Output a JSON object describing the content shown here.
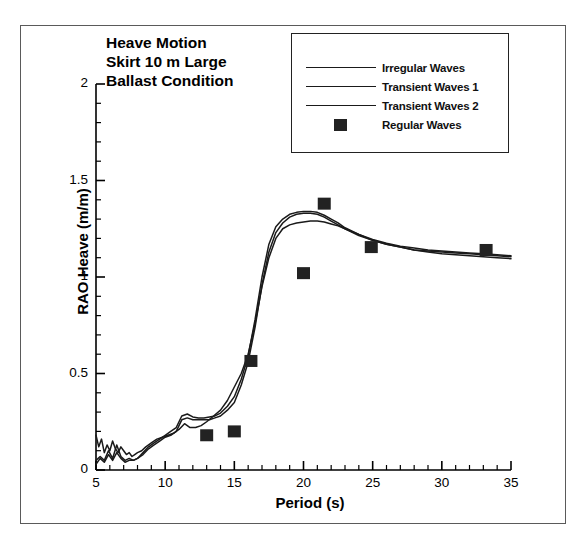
{
  "figure": {
    "title_lines": [
      "Heave Motion",
      "Skirt 10 m Large",
      "Ballast Condition"
    ]
  },
  "legend": {
    "entries": [
      {
        "label": "Irregular Waves",
        "marker": "line"
      },
      {
        "label": "Transient Waves 1",
        "marker": "line"
      },
      {
        "label": "Transient Waves 2",
        "marker": "line"
      },
      {
        "label": "Regular Waves",
        "marker": "square"
      }
    ]
  },
  "axes": {
    "x": {
      "label": "Period (s)",
      "ticks": [
        "5",
        "10",
        "15",
        "20",
        "25",
        "30",
        "35"
      ]
    },
    "y": {
      "label": "RAO Heave (m/m)",
      "ticks": [
        "0",
        "0.5",
        "1",
        "1.5",
        "2"
      ]
    }
  },
  "colors": {
    "line": "#1a1a1a",
    "marker": "#222222",
    "axis": "#000000",
    "frame": "#5a5a5a",
    "background": "#ffffff"
  },
  "chart_data": {
    "type": "line",
    "title": "Heave Motion Skirt 10 m Large Ballast Condition",
    "xlabel": "Period (s)",
    "ylabel": "RAO Heave (m/m)",
    "xlim": [
      5,
      35
    ],
    "ylim": [
      0,
      2
    ],
    "xticks": [
      5,
      10,
      15,
      20,
      25,
      30,
      35
    ],
    "yticks": [
      0,
      0.5,
      1,
      1.5,
      2
    ],
    "xminor_step": 1,
    "yminor_step": 0.1,
    "grid": false,
    "legend_position": "top-right",
    "series": [
      {
        "name": "Irregular Waves",
        "type": "line",
        "x": [
          5.0,
          5.2,
          5.4,
          5.6,
          5.8,
          6.0,
          6.2,
          6.4,
          6.6,
          6.8,
          7.0,
          7.2,
          7.4,
          7.6,
          7.8,
          8.0,
          8.3,
          8.6,
          9.0,
          9.4,
          9.8,
          10.2,
          10.6,
          11.0,
          11.4,
          11.8,
          12.2,
          12.6,
          13.0,
          13.5,
          14.0,
          14.5,
          15.0,
          15.5,
          16.0,
          16.5,
          17.0,
          17.5,
          18.0,
          18.5,
          19.0,
          19.5,
          20.0,
          20.5,
          21.0,
          21.5,
          22.0,
          22.5,
          23.0,
          24.0,
          25.0,
          26.0,
          27.0,
          28.0,
          29.0,
          30.0,
          31.0,
          32.0,
          33.0,
          34.0,
          35.0
        ],
        "y": [
          0.18,
          0.12,
          0.16,
          0.09,
          0.13,
          0.1,
          0.15,
          0.11,
          0.09,
          0.12,
          0.1,
          0.08,
          0.09,
          0.07,
          0.08,
          0.09,
          0.1,
          0.12,
          0.14,
          0.16,
          0.17,
          0.18,
          0.19,
          0.21,
          0.24,
          0.22,
          0.22,
          0.23,
          0.25,
          0.28,
          0.31,
          0.36,
          0.43,
          0.5,
          0.6,
          0.76,
          0.95,
          1.1,
          1.2,
          1.25,
          1.27,
          1.28,
          1.285,
          1.29,
          1.29,
          1.285,
          1.275,
          1.265,
          1.25,
          1.22,
          1.19,
          1.17,
          1.155,
          1.14,
          1.13,
          1.12,
          1.115,
          1.11,
          1.105,
          1.1,
          1.095
        ]
      },
      {
        "name": "Transient Waves 1",
        "type": "line",
        "x": [
          5.0,
          5.3,
          5.6,
          5.9,
          6.2,
          6.5,
          6.8,
          7.1,
          7.4,
          7.7,
          8.0,
          8.4,
          8.8,
          9.2,
          9.6,
          10.0,
          10.4,
          10.8,
          11.2,
          11.6,
          12.0,
          12.4,
          12.8,
          13.2,
          13.6,
          14.0,
          14.5,
          15.0,
          15.5,
          16.0,
          16.5,
          17.0,
          17.5,
          18.0,
          18.5,
          19.0,
          19.5,
          20.0,
          20.5,
          21.0,
          21.5,
          22.0,
          22.5,
          23.0,
          24.0,
          25.0,
          26.0,
          27.0,
          28.0,
          29.0,
          30.0,
          31.0,
          32.0,
          33.0,
          34.0,
          35.0
        ],
        "y": [
          0.05,
          0.07,
          0.05,
          0.1,
          0.06,
          0.13,
          0.07,
          0.05,
          0.06,
          0.05,
          0.06,
          0.08,
          0.11,
          0.13,
          0.15,
          0.17,
          0.18,
          0.2,
          0.26,
          0.27,
          0.26,
          0.26,
          0.26,
          0.26,
          0.27,
          0.28,
          0.31,
          0.35,
          0.44,
          0.56,
          0.74,
          0.96,
          1.13,
          1.23,
          1.28,
          1.31,
          1.325,
          1.33,
          1.33,
          1.325,
          1.31,
          1.29,
          1.27,
          1.25,
          1.215,
          1.19,
          1.17,
          1.155,
          1.14,
          1.135,
          1.13,
          1.125,
          1.12,
          1.115,
          1.11,
          1.105
        ]
      },
      {
        "name": "Transient Waves 2",
        "type": "line",
        "x": [
          5.0,
          5.3,
          5.6,
          5.9,
          6.2,
          6.5,
          6.8,
          7.1,
          7.4,
          7.7,
          8.0,
          8.4,
          8.8,
          9.2,
          9.6,
          10.0,
          10.4,
          10.8,
          11.2,
          11.6,
          12.0,
          12.4,
          12.8,
          13.2,
          13.6,
          14.0,
          14.5,
          15.0,
          15.5,
          16.0,
          16.5,
          17.0,
          17.5,
          18.0,
          18.5,
          19.0,
          19.5,
          20.0,
          20.5,
          21.0,
          21.5,
          22.0,
          22.5,
          23.0,
          24.0,
          25.0,
          26.0,
          27.0,
          28.0,
          29.0,
          30.0,
          31.0,
          32.0,
          33.0,
          34.0,
          35.0
        ],
        "y": [
          0.03,
          0.06,
          0.04,
          0.08,
          0.05,
          0.09,
          0.06,
          0.04,
          0.05,
          0.05,
          0.06,
          0.09,
          0.12,
          0.14,
          0.16,
          0.18,
          0.2,
          0.22,
          0.28,
          0.29,
          0.275,
          0.27,
          0.27,
          0.275,
          0.28,
          0.295,
          0.33,
          0.38,
          0.47,
          0.59,
          0.78,
          1.0,
          1.17,
          1.26,
          1.3,
          1.325,
          1.335,
          1.34,
          1.34,
          1.335,
          1.32,
          1.3,
          1.28,
          1.255,
          1.22,
          1.195,
          1.175,
          1.16,
          1.15,
          1.14,
          1.135,
          1.13,
          1.125,
          1.12,
          1.115,
          1.11
        ]
      },
      {
        "name": "Regular Waves",
        "type": "scatter",
        "marker": "square",
        "x": [
          13.0,
          15.0,
          16.2,
          20.0,
          21.5,
          24.9,
          33.2
        ],
        "y": [
          0.18,
          0.2,
          0.565,
          1.02,
          1.38,
          1.155,
          1.14
        ]
      }
    ]
  }
}
